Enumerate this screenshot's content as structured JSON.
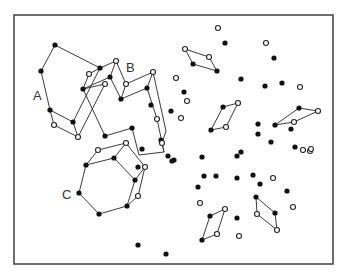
{
  "figure": {
    "frame": {
      "x": 14,
      "y": 15,
      "width": 319,
      "height": 249
    },
    "colors": {
      "line": "#3a3a3a",
      "filled_point": "#111111",
      "open_point": "#ffffff",
      "frame": "#4a4a4a"
    },
    "labels": [
      {
        "text": "A",
        "x": 33,
        "y": 100
      },
      {
        "text": "B",
        "x": 126,
        "y": 72
      },
      {
        "text": "C",
        "x": 62,
        "y": 199
      }
    ],
    "clusters": {
      "A": {
        "label": "A",
        "filled": [
          [
            55,
            45
          ],
          [
            41,
            71
          ],
          [
            50,
            110
          ],
          [
            73,
            122
          ],
          [
            100,
            68
          ],
          [
            83,
            89
          ]
        ],
        "open": [
          [
            54,
            125
          ],
          [
            78,
            137
          ],
          [
            89,
            74
          ],
          [
            105,
            84
          ]
        ],
        "edges": [
          [
            [
              55,
              45
            ],
            [
              41,
              71
            ]
          ],
          [
            [
              41,
              71
            ],
            [
              50,
              110
            ]
          ],
          [
            [
              50,
              110
            ],
            [
              54,
              125
            ]
          ],
          [
            [
              54,
              125
            ],
            [
              78,
              137
            ]
          ],
          [
            [
              50,
              110
            ],
            [
              73,
              122
            ]
          ],
          [
            [
              73,
              122
            ],
            [
              78,
              137
            ]
          ],
          [
            [
              55,
              45
            ],
            [
              100,
              68
            ]
          ],
          [
            [
              100,
              68
            ],
            [
              73,
              122
            ]
          ],
          [
            [
              78,
              137
            ],
            [
              105,
              84
            ]
          ],
          [
            [
              89,
              74
            ],
            [
              83,
              89
            ]
          ],
          [
            [
              100,
              68
            ],
            [
              116,
              61
            ]
          ],
          [
            [
              83,
              89
            ],
            [
              110,
              77
            ]
          ],
          [
            [
              100,
              68
            ],
            [
              89,
              74
            ]
          ],
          [
            [
              83,
              89
            ],
            [
              105,
              84
            ]
          ]
        ]
      },
      "B": {
        "label": "B",
        "filled": [
          [
            110,
            77
          ],
          [
            121,
            99
          ],
          [
            147,
            88
          ],
          [
            151,
            105
          ],
          [
            138,
            167
          ],
          [
            105,
            136
          ],
          [
            132,
            128
          ],
          [
            161,
            140
          ],
          [
            168,
            156
          ],
          [
            172,
            161
          ]
        ],
        "open": [
          [
            116,
            61
          ],
          [
            126,
            84
          ],
          [
            153,
            72
          ],
          [
            157,
            119
          ],
          [
            162,
            143
          ]
        ],
        "edges": [
          [
            [
              116,
              61
            ],
            [
              110,
              77
            ]
          ],
          [
            [
              110,
              77
            ],
            [
              121,
              99
            ]
          ],
          [
            [
              116,
              61
            ],
            [
              126,
              84
            ]
          ],
          [
            [
              126,
              84
            ],
            [
              121,
              99
            ]
          ],
          [
            [
              121,
              99
            ],
            [
              147,
              88
            ]
          ],
          [
            [
              126,
              84
            ],
            [
              153,
              72
            ]
          ],
          [
            [
              153,
              72
            ],
            [
              147,
              88
            ]
          ],
          [
            [
              147,
              88
            ],
            [
              157,
              119
            ]
          ],
          [
            [
              153,
              72
            ],
            [
              166,
              131
            ]
          ],
          [
            [
              166,
              131
            ],
            [
              162,
              143
            ]
          ],
          [
            [
              157,
              119
            ],
            [
              164,
              152
            ]
          ],
          [
            [
              83,
              89
            ],
            [
              105,
              136
            ]
          ],
          [
            [
              105,
              136
            ],
            [
              132,
              128
            ]
          ],
          [
            [
              132,
              128
            ],
            [
              139,
              155
            ]
          ],
          [
            [
              139,
              155
            ],
            [
              164,
              152
            ]
          ],
          [
            [
              162,
              143
            ],
            [
              164,
              152
            ]
          ]
        ]
      },
      "C": {
        "label": "C",
        "filled": [
          [
            79,
            193
          ],
          [
            86,
            165
          ],
          [
            114,
            158
          ],
          [
            135,
            180
          ],
          [
            127,
            206
          ],
          [
            99,
            214
          ],
          [
            142,
            149
          ]
        ],
        "open": [
          [
            98,
            150
          ],
          [
            126,
            143
          ],
          [
            145,
            167
          ],
          [
            138,
            196
          ]
        ],
        "edges": [
          [
            [
              79,
              193
            ],
            [
              86,
              165
            ]
          ],
          [
            [
              86,
              165
            ],
            [
              114,
              158
            ]
          ],
          [
            [
              114,
              158
            ],
            [
              135,
              180
            ]
          ],
          [
            [
              135,
              180
            ],
            [
              127,
              206
            ]
          ],
          [
            [
              127,
              206
            ],
            [
              99,
              214
            ]
          ],
          [
            [
              99,
              214
            ],
            [
              79,
              193
            ]
          ],
          [
            [
              86,
              165
            ],
            [
              98,
              150
            ]
          ],
          [
            [
              98,
              150
            ],
            [
              126,
              143
            ]
          ],
          [
            [
              126,
              143
            ],
            [
              114,
              158
            ]
          ],
          [
            [
              126,
              143
            ],
            [
              145,
              167
            ]
          ],
          [
            [
              145,
              167
            ],
            [
              135,
              180
            ]
          ],
          [
            [
              145,
              167
            ],
            [
              138,
              196
            ]
          ],
          [
            [
              138,
              196
            ],
            [
              127,
              206
            ]
          ]
        ]
      }
    },
    "small_parallelograms": [
      {
        "points": [
          [
            185,
            49
          ],
          [
            209,
            57
          ],
          [
            217,
            71
          ],
          [
            193,
            64
          ]
        ],
        "types": [
          "open",
          "open",
          "filled",
          "filled"
        ]
      },
      {
        "points": [
          [
            299,
            108
          ],
          [
            318,
            111
          ],
          [
            294,
            122
          ],
          [
            275,
            125
          ]
        ],
        "types": [
          "filled",
          "open",
          "open",
          "filled"
        ]
      },
      {
        "points": [
          [
            223,
            107
          ],
          [
            238,
            103
          ],
          [
            226,
            127
          ],
          [
            211,
            130
          ]
        ],
        "types": [
          "filled",
          "open",
          "open",
          "filled"
        ]
      },
      {
        "points": [
          [
            210,
            216
          ],
          [
            225,
            209
          ],
          [
            217,
            234
          ],
          [
            202,
            240
          ]
        ],
        "types": [
          "filled",
          "open",
          "open",
          "filled"
        ]
      },
      {
        "points": [
          [
            256,
            197
          ],
          [
            275,
            213
          ],
          [
            277,
            230
          ],
          [
            257,
            214
          ]
        ],
        "types": [
          "filled",
          "filled",
          "open",
          "open"
        ]
      }
    ],
    "scattered_points": {
      "filled": [
        [
          225,
          43
        ],
        [
          274,
          58
        ],
        [
          184,
          92
        ],
        [
          241,
          79
        ],
        [
          265,
          86
        ],
        [
          282,
          83
        ],
        [
          171,
          111
        ],
        [
          241,
          152
        ],
        [
          258,
          124
        ],
        [
          202,
          157
        ],
        [
          271,
          142
        ],
        [
          295,
          147
        ],
        [
          291,
          129
        ],
        [
          258,
          134
        ],
        [
          237,
          156
        ],
        [
          253,
          175
        ],
        [
          237,
          178
        ],
        [
          260,
          184
        ],
        [
          287,
          191
        ],
        [
          198,
          187
        ],
        [
          174,
          160
        ],
        [
          237,
          218
        ],
        [
          138,
          245
        ],
        [
          166,
          254
        ],
        [
          204,
          176
        ],
        [
          216,
          176
        ]
      ],
      "open": [
        [
          218,
          28
        ],
        [
          266,
          43
        ],
        [
          176,
          78
        ],
        [
          187,
          101
        ],
        [
          181,
          118
        ],
        [
          300,
          87
        ],
        [
          310,
          151
        ],
        [
          273,
          178
        ],
        [
          311,
          149
        ],
        [
          293,
          207
        ],
        [
          200,
          203
        ],
        [
          239,
          236
        ],
        [
          303,
          150
        ]
      ]
    }
  }
}
